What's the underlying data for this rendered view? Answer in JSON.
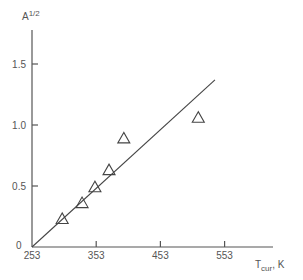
{
  "chart_data": {
    "type": "scatter",
    "title": "",
    "xlabel": "T",
    "xlabel_sub": "cur",
    "xlabel_unit": ", K",
    "ylabel": "A",
    "ylabel_sup": "1/2",
    "xlim": [
      253,
      580
    ],
    "ylim": [
      0,
      1.6
    ],
    "x_ticks": [
      253,
      353,
      453,
      553
    ],
    "x_tick_labels": [
      "253",
      "353",
      "453",
      "553"
    ],
    "y_ticks": [
      0.5,
      1.0,
      1.5
    ],
    "y_tick_labels": [
      "0.5",
      "1.0",
      "1.5"
    ],
    "origin_label": "0",
    "grid": false,
    "series": [
      {
        "name": "data",
        "marker": "open-triangle",
        "points": [
          {
            "x": 300,
            "y": 0.23
          },
          {
            "x": 331,
            "y": 0.36
          },
          {
            "x": 351,
            "y": 0.49
          },
          {
            "x": 373,
            "y": 0.63
          },
          {
            "x": 396,
            "y": 0.89
          },
          {
            "x": 512,
            "y": 1.06
          }
        ]
      }
    ],
    "fit_line": {
      "x": [
        253,
        538
      ],
      "y": [
        0,
        1.37
      ]
    }
  }
}
